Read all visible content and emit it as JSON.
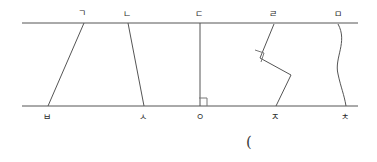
{
  "figure": {
    "kind": "geometry-diagram",
    "stroke_color": "#555555",
    "label_color": "#2b2b2b",
    "background_color": "#ffffff",
    "canvas": {
      "width": 377,
      "height": 162
    },
    "parallel_lines": [
      {
        "name": "top-parallel-line",
        "x1": 22,
        "y1": 23,
        "x2": 358,
        "y2": 23
      },
      {
        "name": "bottom-parallel-line",
        "x1": 22,
        "y1": 106,
        "x2": 358,
        "y2": 106
      }
    ],
    "connectors": [
      {
        "name": "segment-giyeok-bieup",
        "type": "straight",
        "from_label": "ㄱ",
        "to_label": "ㅂ",
        "path": "M 84 23 L 48 106"
      },
      {
        "name": "segment-nieun-siot",
        "type": "straight",
        "from_label": "ㄴ",
        "to_label": "ㅅ",
        "path": "M 128 23 L 144 106"
      },
      {
        "name": "segment-digeut-ieung",
        "type": "perpendicular",
        "from_label": "ㄷ",
        "to_label": "ㅇ",
        "path": "M 200 23 L 200 106"
      },
      {
        "name": "segment-rieul-jieut",
        "type": "zigzag",
        "from_label": "ㄹ",
        "to_label": "ㅈ",
        "path": "M 274 24 L 260 58 L 291 75 L 276 106"
      },
      {
        "name": "segment-mieum-chieut",
        "type": "curve",
        "from_label": "ㅁ",
        "to_label": "ㅊ",
        "path": "M 338 24 C 348 42 334 58 338 74 C 341 88 344 94 346 106"
      }
    ],
    "right_angle_marks": [
      {
        "name": "right-angle-mark-at-ieung",
        "points": "199,98 207,98 207,106"
      },
      {
        "name": "right-angle-mark-at-rieul-vertex",
        "points": "255,50 264,53 261,62"
      }
    ],
    "top_labels": [
      {
        "name": "label-giyeok",
        "text": "ㄱ",
        "x": 82,
        "y": 13
      },
      {
        "name": "label-nieun",
        "text": "ㄴ",
        "x": 127,
        "y": 14
      },
      {
        "name": "label-digeut",
        "text": "ㄷ",
        "x": 199,
        "y": 14
      },
      {
        "name": "label-rieul",
        "text": "ㄹ",
        "x": 273,
        "y": 14
      },
      {
        "name": "label-mieum",
        "text": "ㅁ",
        "x": 338,
        "y": 14
      }
    ],
    "bottom_labels": [
      {
        "name": "label-bieup",
        "text": "ㅂ",
        "x": 47,
        "y": 117
      },
      {
        "name": "label-siot",
        "text": "ㅅ",
        "x": 143,
        "y": 117
      },
      {
        "name": "label-ieung",
        "text": "ㅇ",
        "x": 200,
        "y": 117
      },
      {
        "name": "label-jieut",
        "text": "ㅈ",
        "x": 275,
        "y": 117
      },
      {
        "name": "label-chieut",
        "text": "ㅊ",
        "x": 345,
        "y": 117
      }
    ],
    "stray_marks": [
      {
        "name": "open-parenthesis-mark",
        "text": "(",
        "x": 249,
        "y": 142
      }
    ]
  }
}
